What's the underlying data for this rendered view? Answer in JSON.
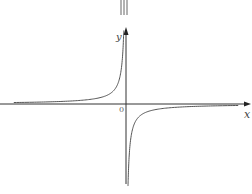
{
  "chart_data": {
    "type": "line",
    "title": "",
    "function": "y = k/x (k < 0)",
    "quadrants": [
      "II",
      "IV"
    ],
    "xlabel": "x",
    "ylabel": "y",
    "origin_label": "0",
    "xlim": [
      -9,
      9
    ],
    "ylim": [
      -6,
      6.5
    ],
    "k": -1,
    "grid": false,
    "legend": "none",
    "series": [
      {
        "name": "branch-quadrant-II",
        "x_range": [
          -8.5,
          -0.17
        ]
      },
      {
        "name": "branch-quadrant-IV",
        "x_range": [
          0.15,
          8.5
        ]
      }
    ],
    "colors": {
      "axis": "#333333",
      "curve": "#555555",
      "background": "#ffffff"
    }
  }
}
